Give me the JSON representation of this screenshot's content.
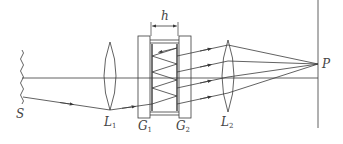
{
  "diagram": {
    "labels": {
      "source": "S",
      "lens1": "L",
      "lens1_sub": "1",
      "plate1": "G",
      "plate1_sub": "1",
      "plate2": "G",
      "plate2_sub": "2",
      "lens2": "L",
      "lens2_sub": "2",
      "focus_point": "P",
      "gap": "h"
    },
    "colors": {
      "line": "#3a3a3a",
      "background": "#ffffff"
    }
  }
}
